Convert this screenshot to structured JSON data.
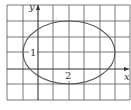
{
  "diagram": {
    "type": "ellipse-on-grid",
    "axes": {
      "x_label": "x",
      "y_label": "y"
    },
    "labels": {
      "semi_minor": "1",
      "semi_major": "2"
    },
    "colors": {
      "grid": "#555555",
      "curve": "#555555",
      "text": "#333333"
    }
  }
}
